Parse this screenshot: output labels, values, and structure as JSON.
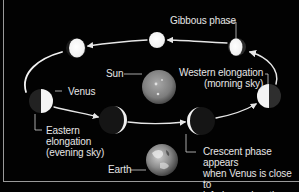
{
  "diagram": {
    "labels": {
      "gibbous": "Gibbous phase",
      "sun": "Sun",
      "venus": "Venus",
      "western": "Western elongation\n(morning sky)",
      "eastern": "Eastern\nelongation\n(evening sky)",
      "earth": "Earth",
      "crescent": "Crescent phase appears\nwhen Venus is close to\ninferior conjunction"
    },
    "colors": {
      "background": "#020202",
      "text": "#e6e6e6",
      "orbit": "#ffffff",
      "frame": "#9a9a9a"
    },
    "bodies": [
      {
        "name": "venus-gibbous-left",
        "x": 76,
        "y": 48,
        "r": 10,
        "phase": "gibbous"
      },
      {
        "name": "venus-full",
        "x": 157,
        "y": 40,
        "r": 8,
        "phase": "full"
      },
      {
        "name": "venus-gibbous",
        "x": 237,
        "y": 47,
        "r": 9,
        "phase": "gibbous"
      },
      {
        "name": "venus-western-elongation",
        "x": 269,
        "y": 96,
        "r": 12,
        "phase": "half-left-lit"
      },
      {
        "name": "venus-eastern-elongation",
        "x": 41,
        "y": 101,
        "r": 12,
        "phase": "half-right-lit"
      },
      {
        "name": "venus-crescent-left",
        "x": 113,
        "y": 120,
        "r": 14,
        "phase": "crescent-right"
      },
      {
        "name": "venus-crescent-right",
        "x": 201,
        "y": 121,
        "r": 14,
        "phase": "crescent-left"
      },
      {
        "name": "sun",
        "x": 159,
        "y": 87,
        "r": 17
      },
      {
        "name": "earth",
        "x": 162,
        "y": 160,
        "r": 16
      }
    ]
  }
}
